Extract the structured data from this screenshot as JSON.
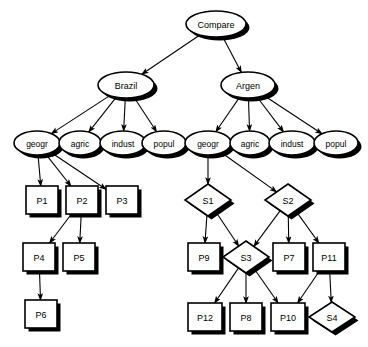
{
  "diagram": {
    "type": "hierarchical-tree",
    "title": "Compare",
    "style": {
      "background": "#ffffff",
      "shape_fill": "#ffffff",
      "stroke": "#000000",
      "shadow": "#000000",
      "edge_color": "#000000"
    },
    "shape_legend": {
      "ellipse": "goal-or-attribute-node",
      "rectangle": "plan-node",
      "diamond": "subgoal-node"
    },
    "nodes": [
      {
        "id": "compare",
        "label": "Compare",
        "shape": "ellipse",
        "cx": 216,
        "cy": 24,
        "rx": 30,
        "ry": 13,
        "font_size": 9
      },
      {
        "id": "brazil",
        "label": "Brazil",
        "shape": "ellipse",
        "cx": 126,
        "cy": 85,
        "rx": 28,
        "ry": 13,
        "font_size": 9
      },
      {
        "id": "argen",
        "label": "Argen",
        "shape": "ellipse",
        "cx": 248,
        "cy": 85,
        "rx": 27,
        "ry": 13,
        "font_size": 9
      },
      {
        "id": "geogr_b",
        "label": "geogr",
        "shape": "ellipse",
        "cx": 37,
        "cy": 143,
        "rx": 23,
        "ry": 12,
        "font_size": 8.5
      },
      {
        "id": "agric_b",
        "label": "agric",
        "shape": "ellipse",
        "cx": 80,
        "cy": 143,
        "rx": 21,
        "ry": 12,
        "font_size": 8.5
      },
      {
        "id": "indust_b",
        "label": "indust",
        "shape": "ellipse",
        "cx": 123,
        "cy": 143,
        "rx": 23,
        "ry": 12,
        "font_size": 8.5
      },
      {
        "id": "popul_b",
        "label": "popul",
        "shape": "ellipse",
        "cx": 164,
        "cy": 143,
        "rx": 22,
        "ry": 12,
        "font_size": 8.5
      },
      {
        "id": "geogr_a",
        "label": "geogr",
        "shape": "ellipse",
        "cx": 208,
        "cy": 143,
        "rx": 23,
        "ry": 12,
        "font_size": 8.5
      },
      {
        "id": "agric_a",
        "label": "agric",
        "shape": "ellipse",
        "cx": 250,
        "cy": 143,
        "rx": 20,
        "ry": 12,
        "font_size": 8.5
      },
      {
        "id": "indust_a",
        "label": "indust",
        "shape": "ellipse",
        "cx": 292,
        "cy": 143,
        "rx": 23,
        "ry": 12,
        "font_size": 8.5
      },
      {
        "id": "popul_a",
        "label": "popul",
        "shape": "ellipse",
        "cx": 336,
        "cy": 143,
        "rx": 22,
        "ry": 12,
        "font_size": 8.5
      },
      {
        "id": "P1",
        "label": "P1",
        "shape": "rect",
        "x": 26,
        "y": 186,
        "w": 32,
        "h": 28,
        "font_size": 9
      },
      {
        "id": "P2",
        "label": "P2",
        "shape": "rect",
        "x": 66,
        "y": 186,
        "w": 32,
        "h": 28,
        "font_size": 9
      },
      {
        "id": "P3",
        "label": "P3",
        "shape": "rect",
        "x": 106,
        "y": 186,
        "w": 32,
        "h": 28,
        "font_size": 9
      },
      {
        "id": "P4",
        "label": "P4",
        "shape": "rect",
        "x": 23,
        "y": 243,
        "w": 32,
        "h": 28,
        "font_size": 9
      },
      {
        "id": "P5",
        "label": "P5",
        "shape": "rect",
        "x": 63,
        "y": 243,
        "w": 32,
        "h": 28,
        "font_size": 9
      },
      {
        "id": "P6",
        "label": "P6",
        "shape": "rect",
        "x": 25,
        "y": 300,
        "w": 32,
        "h": 28,
        "font_size": 9
      },
      {
        "id": "S1",
        "label": "S1",
        "shape": "diamond",
        "cx": 208,
        "cy": 200,
        "rx": 23,
        "ry": 16,
        "font_size": 9
      },
      {
        "id": "S2",
        "label": "S2",
        "shape": "diamond",
        "cx": 288,
        "cy": 200,
        "rx": 23,
        "ry": 16,
        "font_size": 9
      },
      {
        "id": "P9",
        "label": "P9",
        "shape": "rect",
        "x": 188,
        "y": 243,
        "w": 32,
        "h": 28,
        "font_size": 9
      },
      {
        "id": "S3",
        "label": "S3",
        "shape": "diamond",
        "cx": 246,
        "cy": 257,
        "rx": 23,
        "ry": 16,
        "font_size": 9
      },
      {
        "id": "P7",
        "label": "P7",
        "shape": "rect",
        "x": 273,
        "y": 243,
        "w": 32,
        "h": 28,
        "font_size": 9
      },
      {
        "id": "P11",
        "label": "P11",
        "shape": "rect",
        "x": 313,
        "y": 243,
        "w": 32,
        "h": 28,
        "font_size": 9
      },
      {
        "id": "P12",
        "label": "P12",
        "shape": "rect",
        "x": 188,
        "y": 303,
        "w": 34,
        "h": 28,
        "font_size": 9
      },
      {
        "id": "P8",
        "label": "P8",
        "shape": "rect",
        "x": 230,
        "y": 303,
        "w": 32,
        "h": 28,
        "font_size": 9
      },
      {
        "id": "P10",
        "label": "P10",
        "shape": "rect",
        "x": 271,
        "y": 303,
        "w": 34,
        "h": 28,
        "font_size": 9
      },
      {
        "id": "S4",
        "label": "S4",
        "shape": "diamond",
        "cx": 332,
        "cy": 317,
        "rx": 23,
        "ry": 15,
        "font_size": 9
      }
    ],
    "edges": [
      {
        "from": "compare",
        "to": "brazil"
      },
      {
        "from": "compare",
        "to": "argen"
      },
      {
        "from": "brazil",
        "to": "geogr_b"
      },
      {
        "from": "brazil",
        "to": "agric_b"
      },
      {
        "from": "brazil",
        "to": "indust_b"
      },
      {
        "from": "brazil",
        "to": "popul_b"
      },
      {
        "from": "argen",
        "to": "geogr_a"
      },
      {
        "from": "argen",
        "to": "agric_a"
      },
      {
        "from": "argen",
        "to": "indust_a"
      },
      {
        "from": "argen",
        "to": "popul_a"
      },
      {
        "from": "geogr_b",
        "to": "P1"
      },
      {
        "from": "geogr_b",
        "to": "P2"
      },
      {
        "from": "geogr_b",
        "to": "P3"
      },
      {
        "from": "P2",
        "to": "P4"
      },
      {
        "from": "P2",
        "to": "P5"
      },
      {
        "from": "P4",
        "to": "P6"
      },
      {
        "from": "geogr_a",
        "to": "S1"
      },
      {
        "from": "geogr_a",
        "to": "S2"
      },
      {
        "from": "S1",
        "to": "P9"
      },
      {
        "from": "S1",
        "to": "S3"
      },
      {
        "from": "S2",
        "to": "S3"
      },
      {
        "from": "S2",
        "to": "P7"
      },
      {
        "from": "S2",
        "to": "P11"
      },
      {
        "from": "S3",
        "to": "P12"
      },
      {
        "from": "S3",
        "to": "P8"
      },
      {
        "from": "S3",
        "to": "P10"
      },
      {
        "from": "P11",
        "to": "P10"
      },
      {
        "from": "P11",
        "to": "S4"
      }
    ]
  }
}
